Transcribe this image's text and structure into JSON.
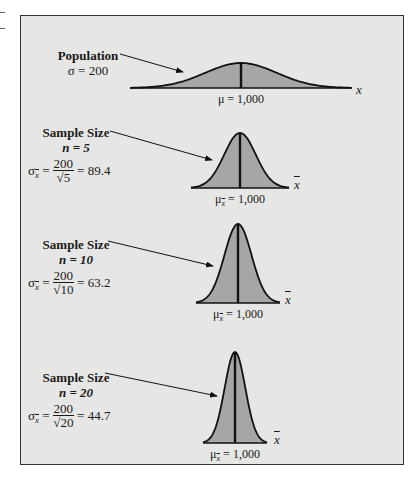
{
  "page_header_fragment": "Sampling Distributions",
  "colors": {
    "frame_background": "#e6e6e4",
    "frame_border": "#333333",
    "curve_fill": "#a6a6a6",
    "curve_stroke": "#111111"
  },
  "panels": [
    {
      "id": "population",
      "title": "Population",
      "param_line": "σ = 200",
      "axis_label": "x",
      "mean_label": "μ = 1,000",
      "sd": 200
    },
    {
      "id": "n5",
      "title": "Sample Size",
      "n_line": "n = 5",
      "sigma_symbol": "σ",
      "sigma_sub": "x",
      "numerator": "200",
      "denominator": "√5",
      "result": "= 89.4",
      "axis_label": "x",
      "mean_symbol": "μ",
      "mean_sub": "x",
      "mean_value": "= 1,000",
      "sd": 89.4
    },
    {
      "id": "n10",
      "title": "Sample Size",
      "n_line": "n = 10",
      "sigma_symbol": "σ",
      "sigma_sub": "x",
      "numerator": "200",
      "denominator": "√10",
      "result": "= 63.2",
      "axis_label": "x",
      "mean_symbol": "μ",
      "mean_sub": "x",
      "mean_value": "= 1,000",
      "sd": 63.2
    },
    {
      "id": "n20",
      "title": "Sample Size",
      "n_line": "n = 20",
      "sigma_symbol": "σ",
      "sigma_sub": "x",
      "numerator": "200",
      "denominator": "√20",
      "result": "= 44.7",
      "axis_label": "x",
      "mean_symbol": "μ",
      "mean_sub": "x",
      "mean_value": "= 1,000",
      "sd": 44.7
    }
  ]
}
